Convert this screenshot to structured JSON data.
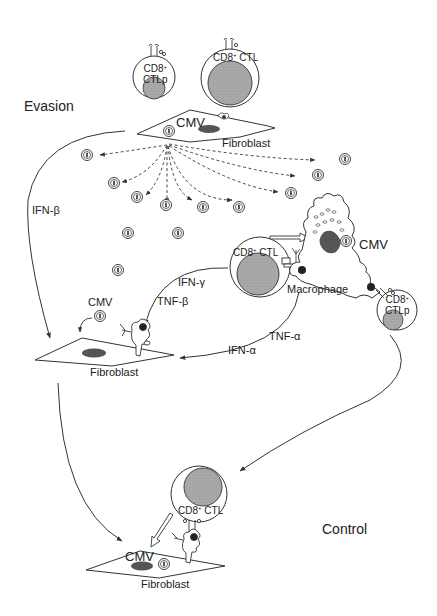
{
  "figure": {
    "sections": {
      "evasion": "Evasion",
      "control": "Control"
    },
    "cells": {
      "ctlp_top": {
        "line1": "CD8",
        "sup": "+",
        "line2": "CTLp"
      },
      "ctl_top": {
        "label": "CD8",
        "sup": "+",
        "suffix": " CTL"
      },
      "fibroblast_top": {
        "virus": "CMV",
        "label": "Fibroblast"
      },
      "ctl_mid": {
        "label": "CD8",
        "sup": "+",
        "suffix": " CTL"
      },
      "macrophage": {
        "label": "Macrophage",
        "virus": "CMV"
      },
      "ctlp_right": {
        "line1": "CD8",
        "sup": "+",
        "line2": "CTLp"
      },
      "fibroblast_mid": {
        "virus": "CMV",
        "label": "Fibroblast"
      },
      "ctl_bottom": {
        "label": "CD8",
        "sup": "+",
        "suffix": " CTL"
      },
      "fibroblast_bottom": {
        "virus": "CMV",
        "label": "Fibroblast"
      }
    },
    "cytokines": {
      "ifn_beta": "IFN-β",
      "ifn_gamma": "IFN-γ",
      "tnf_beta": "TNF-β",
      "tnf_alpha": "TNF-α",
      "ifn_alpha": "IFN-α"
    },
    "colors": {
      "line": "#333333",
      "nucleus": "#555555",
      "cell_fill_gray": "#b0b0b0",
      "background": "#ffffff"
    }
  }
}
